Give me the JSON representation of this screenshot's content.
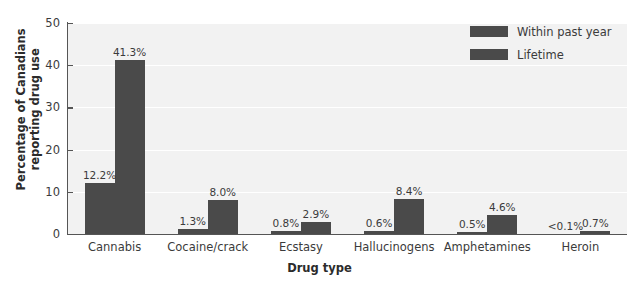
{
  "chart_data": {
    "type": "bar",
    "title": "",
    "xlabel": "Drug type",
    "ylabel": "Percentage of Canadians reporting drug use",
    "ylabel_lines": [
      "Percentage of Canadians",
      "reporting drug use"
    ],
    "categories": [
      "Cannabis",
      "Cocaine/crack",
      "Ecstasy",
      "Hallucinogens",
      "Amphetamines",
      "Heroin"
    ],
    "series": [
      {
        "name": "Within past year",
        "values": [
          12.2,
          1.3,
          0.8,
          0.6,
          0.5,
          0.05
        ],
        "labels": [
          "12.2%",
          "1.3%",
          "0.8%",
          "0.6%",
          "0.5%",
          "<0.1%"
        ],
        "color": "#4a4a4a"
      },
      {
        "name": "Lifetime",
        "values": [
          41.3,
          8.0,
          2.9,
          8.4,
          4.6,
          0.7
        ],
        "labels": [
          "41.3%",
          "8.0%",
          "2.9%",
          "8.4%",
          "4.6%",
          "0.7%"
        ],
        "color": "#4a4a4a"
      }
    ],
    "ylim": [
      0,
      50
    ],
    "yticks": [
      0,
      10,
      20,
      30,
      40,
      50
    ],
    "ytick_labels": [
      "0",
      "10",
      "20",
      "30",
      "40",
      "50"
    ],
    "grid": true,
    "grid_axis": "y",
    "legend_position": "top-right",
    "plot_background": "#f2f2f2",
    "figure_background": "#ffffff",
    "axis_color": "#555555"
  }
}
